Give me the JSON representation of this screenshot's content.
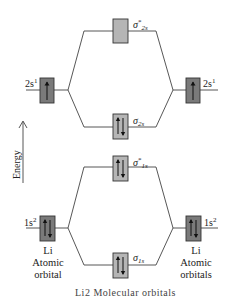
{
  "title": "Li2 Molecular orbitals",
  "colors": {
    "line": "#444444",
    "atomic_box_fill": "#7a7a7a",
    "molecular_box_fill": "#b5b5b5",
    "box_stroke": "#333333"
  },
  "axis": {
    "label": "Energy"
  },
  "atomic_orbitals": {
    "left_2s": {
      "label_main": "2s",
      "label_sup": "1",
      "electrons": "up"
    },
    "right_2s": {
      "label_main": "2s",
      "label_sup": "1",
      "electrons": "up"
    },
    "left_1s": {
      "label_main": "1s",
      "label_sup": "2",
      "electrons": "up-down"
    },
    "right_1s": {
      "label_main": "1s",
      "label_sup": "2",
      "electrons": "up-down"
    }
  },
  "molecular_orbitals": {
    "sigma_star_2s": {
      "symbol": "σ",
      "sup": "*",
      "sub": "2s",
      "electrons": "empty"
    },
    "sigma_2s": {
      "symbol": "σ",
      "sup": "",
      "sub": "2s",
      "electrons": "up-down"
    },
    "sigma_star_1s": {
      "symbol": "σ",
      "sup": "*",
      "sub": "1s",
      "electrons": "up-down"
    },
    "sigma_1s": {
      "symbol": "σ",
      "sup": "",
      "sub": "1s",
      "electrons": "up-down"
    }
  },
  "labels": {
    "left_atom": [
      "Li",
      "Atomic",
      "orbital"
    ],
    "right_atom": [
      "Li",
      "Atomic",
      "orbitals"
    ],
    "caption": "Li2 Molecular orbitals"
  }
}
